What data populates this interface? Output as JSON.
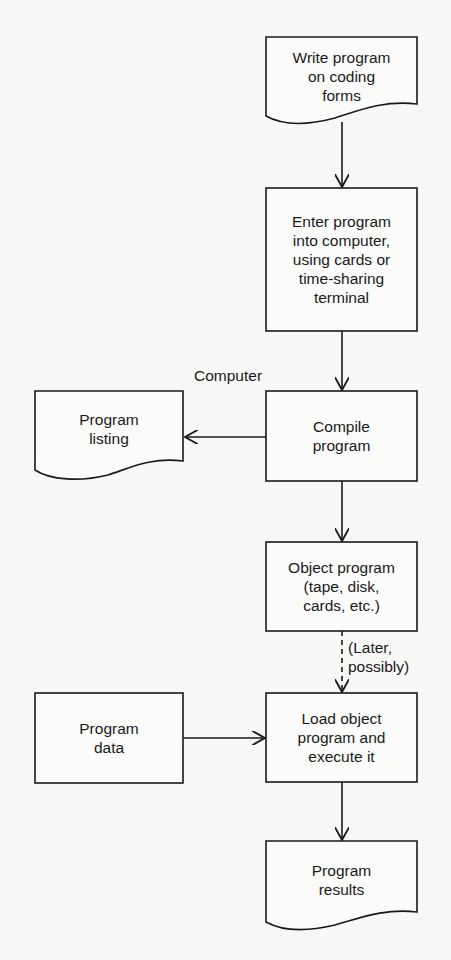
{
  "diagram": {
    "type": "flowchart",
    "nodes": [
      {
        "id": "write",
        "shape": "document",
        "text": "Write program\non coding\nforms"
      },
      {
        "id": "enter",
        "shape": "process",
        "text": "Enter program\ninto computer,\nusing cards or\ntime-sharing\nterminal"
      },
      {
        "id": "compile",
        "shape": "process",
        "text": "Compile\nprogram"
      },
      {
        "id": "listing",
        "shape": "document",
        "text": "Program\nlisting"
      },
      {
        "id": "object",
        "shape": "process",
        "text": "Object program\n(tape, disk,\ncards, etc.)"
      },
      {
        "id": "data",
        "shape": "process",
        "text": "Program\ndata"
      },
      {
        "id": "load",
        "shape": "process",
        "text": "Load object\nprogram and\nexecute it"
      },
      {
        "id": "results",
        "shape": "document",
        "text": "Program\nresults"
      }
    ],
    "edges": [
      {
        "from": "write",
        "to": "enter",
        "style": "solid"
      },
      {
        "from": "enter",
        "to": "compile",
        "style": "solid"
      },
      {
        "from": "compile",
        "to": "listing",
        "style": "solid"
      },
      {
        "from": "compile",
        "to": "object",
        "style": "solid"
      },
      {
        "from": "object",
        "to": "load",
        "style": "dashed",
        "label": "(Later,\npossibly)"
      },
      {
        "from": "data",
        "to": "load",
        "style": "solid"
      },
      {
        "from": "load",
        "to": "results",
        "style": "solid"
      }
    ],
    "annotations": {
      "computer_label": "Computer",
      "later_label": "(Later,\npossibly)"
    }
  }
}
